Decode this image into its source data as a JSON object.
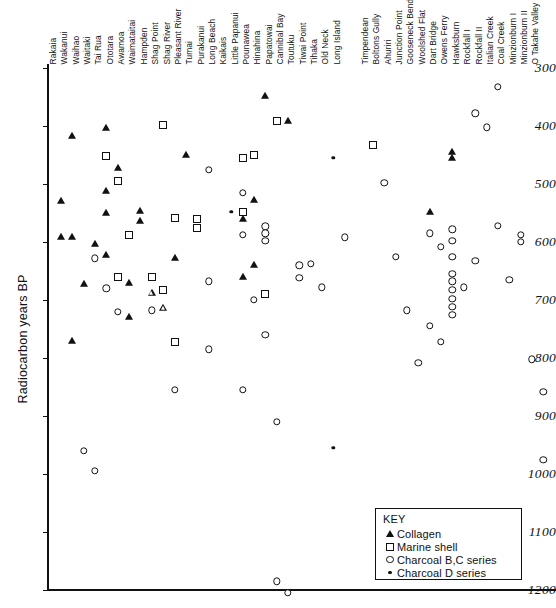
{
  "chart_data": {
    "type": "scatter",
    "title": "",
    "xlabel": "",
    "ylabel": "Radiocarbon years BP",
    "ylim": [
      300,
      1200
    ],
    "y_inverted": true,
    "yticks": [
      300,
      400,
      500,
      600,
      700,
      800,
      900,
      1000,
      1100,
      1200
    ],
    "grid": false,
    "legend_position": "bottom-right",
    "legend_title": "KEY",
    "series": [
      {
        "name": "Collagen",
        "marker": "filled-triangle",
        "color": "#111111"
      },
      {
        "name": "Marine shell",
        "marker": "open-square",
        "color": "#111111"
      },
      {
        "name": "Charcoal B,C series",
        "marker": "open-circle",
        "color": "#111111"
      },
      {
        "name": "Charcoal D series",
        "marker": "filled-circle",
        "color": "#111111"
      }
    ],
    "categories": [
      "Rakaia",
      "Wakanui",
      "Waihao",
      "Waitaki",
      "Tai Rua",
      "Ototara",
      "Awamoa",
      "Waimataitai",
      "Hampden",
      "Shag Point",
      "Shag River",
      "Pleasant River",
      "Tumai",
      "Purakanui",
      "Long Beach",
      "Kaikais",
      "Little Papanui",
      "Pounawea",
      "Hinahina",
      "Papatowai",
      "Cannibal Bay",
      "Toutuku",
      "Tiwai Point",
      "Tihaka",
      "Old Neck",
      "Long Island",
      "Timpendean",
      "Boltons Gully",
      "Ahuriri",
      "Junction Point",
      "Gooseneck Bend",
      "Woolshed Flat",
      "Dart Bridge",
      "Owens Ferry",
      "Hawksburn",
      "Rockfall I",
      "Rockfall II",
      "Italian Creek",
      "Coal Creek",
      "Minzionburn I",
      "Minzionburn II",
      "O Takahe Valley"
    ],
    "points": [
      {
        "site": "Rakaia",
        "value": 530,
        "series": "Collagen"
      },
      {
        "site": "Rakaia",
        "value": 592,
        "series": "Collagen"
      },
      {
        "site": "Wakanui",
        "value": 418,
        "series": "Collagen"
      },
      {
        "site": "Wakanui",
        "value": 592,
        "series": "Collagen"
      },
      {
        "site": "Wakanui",
        "value": 770,
        "series": "Collagen"
      },
      {
        "site": "Waihao",
        "value": 672,
        "series": "Collagen"
      },
      {
        "site": "Waihao",
        "value": 960,
        "series": "Charcoal B,C series"
      },
      {
        "site": "Waitaki",
        "value": 604,
        "series": "Collagen"
      },
      {
        "site": "Waitaki",
        "value": 628,
        "series": "Charcoal B,C series"
      },
      {
        "site": "Waitaki",
        "value": 995,
        "series": "Charcoal B,C series"
      },
      {
        "site": "Tai Rua",
        "value": 403,
        "series": "Collagen"
      },
      {
        "site": "Tai Rua",
        "value": 452,
        "series": "Marine shell"
      },
      {
        "site": "Tai Rua",
        "value": 512,
        "series": "Collagen"
      },
      {
        "site": "Tai Rua",
        "value": 550,
        "series": "Collagen"
      },
      {
        "site": "Tai Rua",
        "value": 623,
        "series": "Collagen"
      },
      {
        "site": "Tai Rua",
        "value": 680,
        "series": "Charcoal B,C series"
      },
      {
        "site": "Ototara",
        "value": 472,
        "series": "Collagen"
      },
      {
        "site": "Ototara",
        "value": 494,
        "series": "Marine shell"
      },
      {
        "site": "Ototara",
        "value": 660,
        "series": "Marine shell"
      },
      {
        "site": "Ototara",
        "value": 720,
        "series": "Charcoal B,C series"
      },
      {
        "site": "Awamoa",
        "value": 588,
        "series": "Marine shell"
      },
      {
        "site": "Awamoa",
        "value": 670,
        "series": "Collagen"
      },
      {
        "site": "Awamoa",
        "value": 730,
        "series": "Collagen"
      },
      {
        "site": "Waimataitai",
        "value": 546,
        "series": "Collagen"
      },
      {
        "site": "Waimataitai",
        "value": 564,
        "series": "Collagen"
      },
      {
        "site": "Hampden",
        "value": 660,
        "series": "Marine shell"
      },
      {
        "site": "Hampden",
        "value": 688,
        "series": "Open triangle"
      },
      {
        "site": "Hampden",
        "value": 718,
        "series": "Charcoal B,C series"
      },
      {
        "site": "Shag Point",
        "value": 398,
        "series": "Marine shell"
      },
      {
        "site": "Shag Point",
        "value": 683,
        "series": "Marine shell"
      },
      {
        "site": "Shag Point",
        "value": 713,
        "series": "Open triangle"
      },
      {
        "site": "Shag River",
        "value": 558,
        "series": "Marine shell"
      },
      {
        "site": "Shag River",
        "value": 628,
        "series": "Collagen"
      },
      {
        "site": "Shag River",
        "value": 772,
        "series": "Marine shell"
      },
      {
        "site": "Shag River",
        "value": 855,
        "series": "Charcoal B,C series"
      },
      {
        "site": "Pleasant River",
        "value": 450,
        "series": "Collagen"
      },
      {
        "site": "Tumai",
        "value": 560,
        "series": "Marine shell"
      },
      {
        "site": "Tumai",
        "value": 575,
        "series": "Marine shell"
      },
      {
        "site": "Purakanui",
        "value": 475,
        "series": "Charcoal B,C series"
      },
      {
        "site": "Purakanui",
        "value": 668,
        "series": "Charcoal B,C series"
      },
      {
        "site": "Purakanui",
        "value": 785,
        "series": "Charcoal B,C series"
      },
      {
        "site": "Kaikais",
        "value": 548,
        "series": "Charcoal D series"
      },
      {
        "site": "Little Papanui",
        "value": 455,
        "series": "Marine shell"
      },
      {
        "site": "Little Papanui",
        "value": 515,
        "series": "Charcoal B,C series"
      },
      {
        "site": "Little Papanui",
        "value": 548,
        "series": "Marine shell"
      },
      {
        "site": "Little Papanui",
        "value": 560,
        "series": "Collagen"
      },
      {
        "site": "Little Papanui",
        "value": 588,
        "series": "Charcoal B,C series"
      },
      {
        "site": "Little Papanui",
        "value": 660,
        "series": "Collagen"
      },
      {
        "site": "Little Papanui",
        "value": 855,
        "series": "Charcoal B,C series"
      },
      {
        "site": "Pounawea",
        "value": 450,
        "series": "Marine shell"
      },
      {
        "site": "Pounawea",
        "value": 528,
        "series": "Collagen"
      },
      {
        "site": "Pounawea",
        "value": 640,
        "series": "Collagen"
      },
      {
        "site": "Pounawea",
        "value": 700,
        "series": "Charcoal B,C series"
      },
      {
        "site": "Hinahina",
        "value": 348,
        "series": "Collagen"
      },
      {
        "site": "Hinahina",
        "value": 573,
        "series": "Charcoal B,C series"
      },
      {
        "site": "Hinahina",
        "value": 585,
        "series": "Charcoal B,C series"
      },
      {
        "site": "Hinahina",
        "value": 598,
        "series": "Charcoal B,C series"
      },
      {
        "site": "Hinahina",
        "value": 690,
        "series": "Marine shell"
      },
      {
        "site": "Hinahina",
        "value": 760,
        "series": "Charcoal B,C series"
      },
      {
        "site": "Papatowai",
        "value": 392,
        "series": "Marine shell"
      },
      {
        "site": "Papatowai",
        "value": 910,
        "series": "Charcoal B,C series"
      },
      {
        "site": "Papatowai",
        "value": 1185,
        "series": "Charcoal B,C series"
      },
      {
        "site": "Cannibal Bay",
        "value": 392,
        "series": "Collagen"
      },
      {
        "site": "Cannibal Bay",
        "value": 1205,
        "series": "Charcoal B,C series"
      },
      {
        "site": "Toutuku",
        "value": 640,
        "series": "Charcoal B,C series"
      },
      {
        "site": "Toutuku",
        "value": 662,
        "series": "Charcoal B,C series"
      },
      {
        "site": "Tiwai Point",
        "value": 638,
        "series": "Charcoal B,C series"
      },
      {
        "site": "Tihaka",
        "value": 678,
        "series": "Charcoal B,C series"
      },
      {
        "site": "Old Neck",
        "value": 455,
        "series": "Charcoal D series"
      },
      {
        "site": "Old Neck",
        "value": 955,
        "series": "Charcoal D series"
      },
      {
        "site": "Long Island",
        "value": 592,
        "series": "Charcoal B,C series"
      },
      {
        "site": "Timpendean",
        "value": 432,
        "series": "Marine shell"
      },
      {
        "site": "Boltons Gully",
        "value": 498,
        "series": "Charcoal B,C series"
      },
      {
        "site": "Ahuriri",
        "value": 625,
        "series": "Charcoal B,C series"
      },
      {
        "site": "Junction Point",
        "value": 718,
        "series": "Charcoal B,C series"
      },
      {
        "site": "Gooseneck Bend",
        "value": 808,
        "series": "Charcoal B,C series"
      },
      {
        "site": "Woolshed Flat",
        "value": 548,
        "series": "Collagen"
      },
      {
        "site": "Woolshed Flat",
        "value": 585,
        "series": "Charcoal B,C series"
      },
      {
        "site": "Woolshed Flat",
        "value": 745,
        "series": "Charcoal B,C series"
      },
      {
        "site": "Dart Bridge",
        "value": 608,
        "series": "Charcoal B,C series"
      },
      {
        "site": "Dart Bridge",
        "value": 772,
        "series": "Charcoal B,C series"
      },
      {
        "site": "Owens Ferry",
        "value": 445,
        "series": "Collagen"
      },
      {
        "site": "Owens Ferry",
        "value": 455,
        "series": "Collagen"
      },
      {
        "site": "Owens Ferry",
        "value": 578,
        "series": "Charcoal B,C series"
      },
      {
        "site": "Owens Ferry",
        "value": 598,
        "series": "Charcoal B,C series"
      },
      {
        "site": "Owens Ferry",
        "value": 625,
        "series": "Charcoal B,C series"
      },
      {
        "site": "Owens Ferry",
        "value": 655,
        "series": "Charcoal B,C series"
      },
      {
        "site": "Owens Ferry",
        "value": 668,
        "series": "Charcoal B,C series"
      },
      {
        "site": "Owens Ferry",
        "value": 682,
        "series": "Charcoal B,C series"
      },
      {
        "site": "Owens Ferry",
        "value": 698,
        "series": "Charcoal B,C series"
      },
      {
        "site": "Owens Ferry",
        "value": 712,
        "series": "Charcoal B,C series"
      },
      {
        "site": "Owens Ferry",
        "value": 726,
        "series": "Charcoal B,C series"
      },
      {
        "site": "Hawksburn",
        "value": 678,
        "series": "Charcoal B,C series"
      },
      {
        "site": "Rockfall I",
        "value": 378,
        "series": "Charcoal B,C series"
      },
      {
        "site": "Rockfall I",
        "value": 632,
        "series": "Charcoal B,C series"
      },
      {
        "site": "Rockfall II",
        "value": 402,
        "series": "Charcoal B,C series"
      },
      {
        "site": "Italian Creek",
        "value": 332,
        "series": "Charcoal B,C series"
      },
      {
        "site": "Italian Creek",
        "value": 572,
        "series": "Charcoal B,C series"
      },
      {
        "site": "Coal Creek",
        "value": 665,
        "series": "Charcoal B,C series"
      },
      {
        "site": "Minzionburn I",
        "value": 588,
        "series": "Charcoal B,C series"
      },
      {
        "site": "Minzionburn I",
        "value": 600,
        "series": "Charcoal B,C series"
      },
      {
        "site": "Minzionburn II",
        "value": 802,
        "series": "Charcoal B,C series"
      },
      {
        "site": "O Takahe Valley",
        "value": 858,
        "series": "Charcoal B,C series"
      },
      {
        "site": "O Takahe Valley",
        "value": 975,
        "series": "Charcoal B,C series"
      }
    ]
  },
  "axis": {
    "ylabel": "Radiocarbon years BP",
    "yticks": [
      "300",
      "400",
      "500",
      "600",
      "700",
      "800",
      "900",
      "1000",
      "1100",
      "1200"
    ]
  },
  "key": {
    "title": "KEY",
    "entries": [
      {
        "label": "Collagen",
        "symbol": "filled-triangle-icon"
      },
      {
        "label": "Marine shell",
        "symbol": "open-square-icon"
      },
      {
        "label": "Charcoal B,C series",
        "symbol": "open-circle-icon"
      },
      {
        "label": "Charcoal D series",
        "symbol": "filled-circle-icon"
      }
    ]
  },
  "sites": [
    "Rakaia",
    "Wakanui",
    "Waihao",
    "Waitaki",
    "Tai Rua",
    "Ototara",
    "Awamoa",
    "Waimataitai",
    "Hampden",
    "Shag Point",
    "Shag River",
    "Pleasant River",
    "Tumai",
    "Purakanui",
    "Long Beach",
    "Kaikais",
    "Little Papanui",
    "Pounawea",
    "Hinahina",
    "Papatowai",
    "Cannibal Bay",
    "Toutuku",
    "Tiwai Point",
    "Tihaka",
    "Old Neck",
    "Long Island",
    "Timpendean",
    "Boltons Gully",
    "Ahuriri",
    "Junction Point",
    "Gooseneck Bend",
    "Woolshed Flat",
    "Dart Bridge",
    "Owens Ferry",
    "Hawksburn",
    "Rockfall I",
    "Rockfall II",
    "Italian Creek",
    "Coal Creek",
    "Minzionburn I",
    "Minzionburn II",
    "O Takahe Valley"
  ]
}
